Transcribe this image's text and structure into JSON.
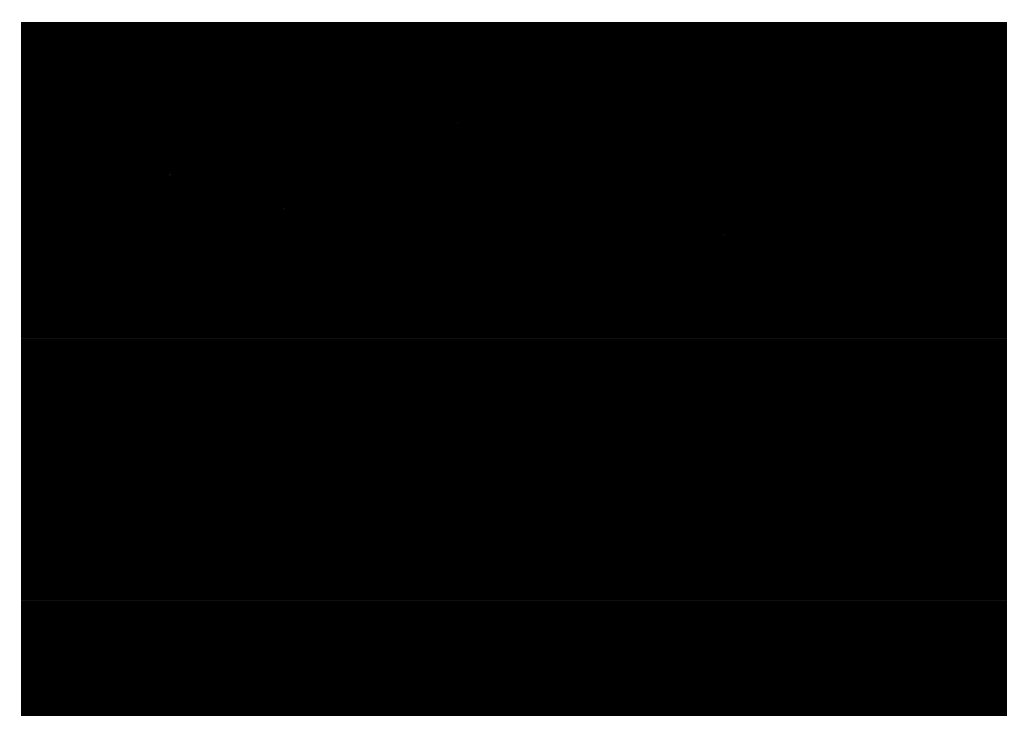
{
  "page": {
    "background_color": "#ffffff",
    "width": 1028,
    "height": 736,
    "kind": "photograph"
  },
  "photo": {
    "title": "Cratered icy moon limb with chasms",
    "alt_text": "Grayscale spacecraft image of a heavily cratered icy moon, showing the curved limb against black space, a tall mountain peak on the upper ridge, long linear chasms running down the disk, and a dark patch on the left plains.",
    "frame": {
      "x": 21,
      "y": 22,
      "width": 986,
      "height": 694
    },
    "border_color": "#ffffff",
    "space_color": "#000000",
    "surface_colors": {
      "highlight": "#d8d8d8",
      "midtone": "#8e8e8e",
      "shadow": "#3a3a3a",
      "deep_shadow": "#101010",
      "dark_patch": "#5a5a5a"
    },
    "lighting": {
      "sun_direction": "upper-left",
      "terminator": "none-visible"
    }
  },
  "scene": {
    "body": {
      "name": "icy-moon-disk",
      "limb_center_x": 520,
      "limb_center_y": 980,
      "limb_radius_x": 560,
      "limb_radius_y": 800
    },
    "features": [
      {
        "name": "summit-peak",
        "type": "mountain",
        "x": 545,
        "y": 188,
        "size": 42,
        "brightness": "bright"
      },
      {
        "name": "ridge-crest",
        "type": "ridge",
        "x": 470,
        "y": 215,
        "size": 300,
        "brightness": "bright"
      },
      {
        "name": "chasma-central",
        "type": "chasm",
        "x": 590,
        "y": 470,
        "size": 300,
        "brightness": "dark"
      },
      {
        "name": "chasma-east",
        "type": "chasm",
        "x": 690,
        "y": 440,
        "size": 260,
        "brightness": "dark"
      },
      {
        "name": "chasma-west",
        "type": "chasm",
        "x": 505,
        "y": 430,
        "size": 230,
        "brightness": "dark"
      },
      {
        "name": "dark-patch-left",
        "type": "albedo-spot",
        "x": 110,
        "y": 450,
        "size": 90,
        "brightness": "dark"
      },
      {
        "name": "crater-field-east",
        "type": "craters",
        "x": 860,
        "y": 560,
        "size": 260,
        "brightness": "mixed"
      },
      {
        "name": "smooth-plains",
        "type": "plains",
        "x": 200,
        "y": 600,
        "size": 300,
        "brightness": "mid"
      }
    ],
    "star_specks": [
      {
        "x": 148,
        "y": 152,
        "brightness": 0.3
      },
      {
        "x": 262,
        "y": 186,
        "brightness": 0.18
      },
      {
        "x": 702,
        "y": 212,
        "brightness": 0.16
      },
      {
        "x": 436,
        "y": 100,
        "brightness": 0.12
      }
    ]
  }
}
